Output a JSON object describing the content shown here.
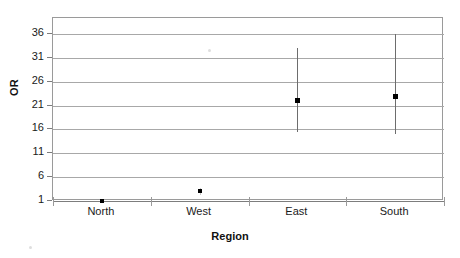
{
  "chart_data": {
    "type": "scatter",
    "title": "",
    "subtitle": "",
    "xlabel": "Region",
    "ylabel": "OR",
    "categories": [
      "North",
      "West",
      "East",
      "South"
    ],
    "values": [
      1,
      3,
      22,
      23
    ],
    "error_low": [
      1,
      2.4,
      15.5,
      15
    ],
    "error_high": [
      1,
      3.8,
      33,
      36
    ],
    "series": [
      {
        "name": "Odds Ratio",
        "points": [
          {
            "category": "North",
            "value": 1,
            "ci_low": 1,
            "ci_high": 1
          },
          {
            "category": "West",
            "value": 3,
            "ci_low": 2.4,
            "ci_high": 3.8
          },
          {
            "category": "East",
            "value": 22,
            "ci_low": 15.5,
            "ci_high": 33
          },
          {
            "category": "South",
            "value": 23,
            "ci_low": 15,
            "ci_high": 36
          }
        ]
      }
    ],
    "yticks": [
      1,
      6,
      11,
      16,
      21,
      26,
      31,
      36
    ],
    "ylim": [
      1,
      36.7
    ],
    "xlim": [
      0,
      4
    ],
    "grid": "horizontal",
    "legend": "none",
    "marker_color": "#000000",
    "gridline_color": "#a8a8a8",
    "frame_color": "#9a9a9a"
  },
  "axes": {
    "y": {
      "title": "OR",
      "ticks": [
        "36",
        "31",
        "26",
        "21",
        "16",
        "11",
        "6",
        "1"
      ]
    },
    "x": {
      "title": "Region",
      "categories": [
        "North",
        "West",
        "East",
        "South"
      ]
    }
  }
}
